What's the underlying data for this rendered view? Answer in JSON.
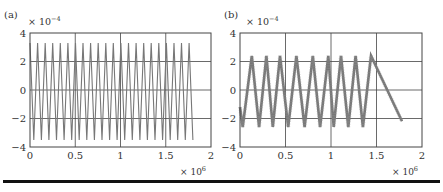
{
  "figure": {
    "panels": [
      {
        "label": "(a)",
        "exponent_y": "× 10",
        "exponent_y_sup": "−4",
        "exponent_x": "× 10",
        "exponent_x_sup": "6"
      },
      {
        "label": "(b)",
        "exponent_y": "× 10",
        "exponent_y_sup": "−4",
        "exponent_x": "× 10",
        "exponent_x_sup": "6"
      }
    ]
  },
  "chart_data": [
    {
      "type": "line",
      "title": "(a)",
      "xlabel": "",
      "ylabel": "",
      "x_scale_note": "× 10^6",
      "y_scale_note": "× 10^-4",
      "xlim": [
        0,
        2
      ],
      "ylim": [
        -4,
        4
      ],
      "xticks": [
        "0",
        "0.5",
        "1",
        "1.5",
        "2"
      ],
      "yticks": [
        "4",
        "2",
        "0",
        "−2",
        "−4"
      ],
      "grid": true,
      "line_color": "#777777",
      "description": "Dense oscillation (~21 cycles) spanning x=0 to ~1.8, amplitude about ±3.4",
      "series": [
        {
          "name": "signal",
          "x_end": 1.8,
          "cycles": 21.5,
          "peak": 3.3,
          "trough": -3.5,
          "shape": "triangle"
        }
      ]
    },
    {
      "type": "line",
      "title": "(b)",
      "xlabel": "",
      "ylabel": "",
      "x_scale_note": "× 10^6",
      "y_scale_note": "× 10^-4",
      "xlim": [
        0,
        2
      ],
      "ylim": [
        -4,
        4
      ],
      "xticks": [
        "0",
        "0.5",
        "1",
        "1.5",
        "2"
      ],
      "yticks": [
        "4",
        "2",
        "0",
        "−2",
        "−4"
      ],
      "grid": true,
      "line_color": "#777777",
      "description": "Triangle-wave oscillation (~9 cycles) spanning x=0 to ~1.78, amplitude about ±2.4, thick noisy trace",
      "series": [
        {
          "name": "signal",
          "x_end": 1.78,
          "peaks_x": [
            0.13,
            0.29,
            0.44,
            0.62,
            0.8,
            0.97,
            1.11,
            1.27,
            1.44
          ],
          "troughs_x": [
            0.03,
            0.21,
            0.36,
            0.53,
            0.71,
            0.88,
            1.03,
            1.19,
            1.35
          ],
          "end_x": 1.78,
          "peak": 2.4,
          "trough": -2.6,
          "shape": "triangle"
        }
      ]
    }
  ]
}
